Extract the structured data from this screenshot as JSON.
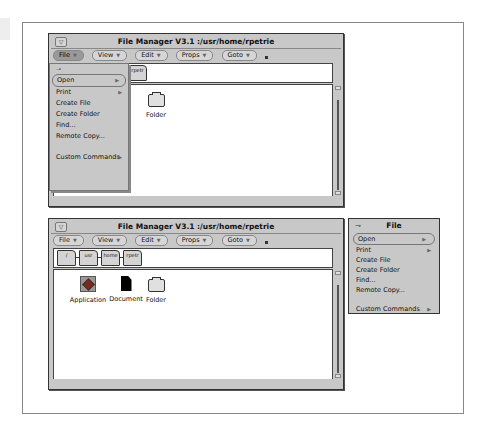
{
  "top_window": {
    "title": "File Manager V3.1  :/usr/home/rpetrie",
    "menus": [
      {
        "label": "File",
        "active": true
      },
      {
        "label": "View"
      },
      {
        "label": "Edit"
      },
      {
        "label": "Props"
      },
      {
        "label": "Goto"
      }
    ],
    "path_nodes": [
      "rpetr"
    ],
    "visible_items": [
      {
        "label": "nt"
      },
      {
        "label": "Folder"
      }
    ],
    "file_menu": {
      "pin_glyph": "⊸",
      "items": [
        {
          "label": "Open",
          "default": true,
          "submenu": true
        },
        {
          "label": "Print",
          "submenu": true
        },
        {
          "label": "Create File"
        },
        {
          "label": "Create Folder"
        },
        {
          "label": "Find..."
        },
        {
          "label": "Remote Copy..."
        },
        {
          "label": "Custom Commands",
          "submenu": true
        }
      ]
    }
  },
  "bottom_window": {
    "title": "File Manager V3.1  :/usr/home/rpetrie",
    "menus": [
      {
        "label": "File"
      },
      {
        "label": "View"
      },
      {
        "label": "Edit"
      },
      {
        "label": "Props"
      },
      {
        "label": "Goto"
      }
    ],
    "path_nodes": [
      "/",
      "usr",
      "home",
      "rpetr"
    ],
    "items": [
      {
        "label": "Application",
        "type": "application"
      },
      {
        "label": "Document",
        "type": "document"
      },
      {
        "label": "Folder",
        "type": "folder"
      }
    ]
  },
  "pinned_menu": {
    "title": "File",
    "pin_glyph": "⊸",
    "items": [
      {
        "label": "Open",
        "default": true,
        "submenu": true
      },
      {
        "label": "Print",
        "submenu": true
      },
      {
        "label": "Create File"
      },
      {
        "label": "Create Folder"
      },
      {
        "label": "Find..."
      },
      {
        "label": "Remote Copy..."
      },
      {
        "label": "Custom Commands",
        "submenu": true
      }
    ]
  },
  "glyphs": {
    "menu_triangle": "▼",
    "submenu_arrow": "▶",
    "window_menu": "▽"
  }
}
